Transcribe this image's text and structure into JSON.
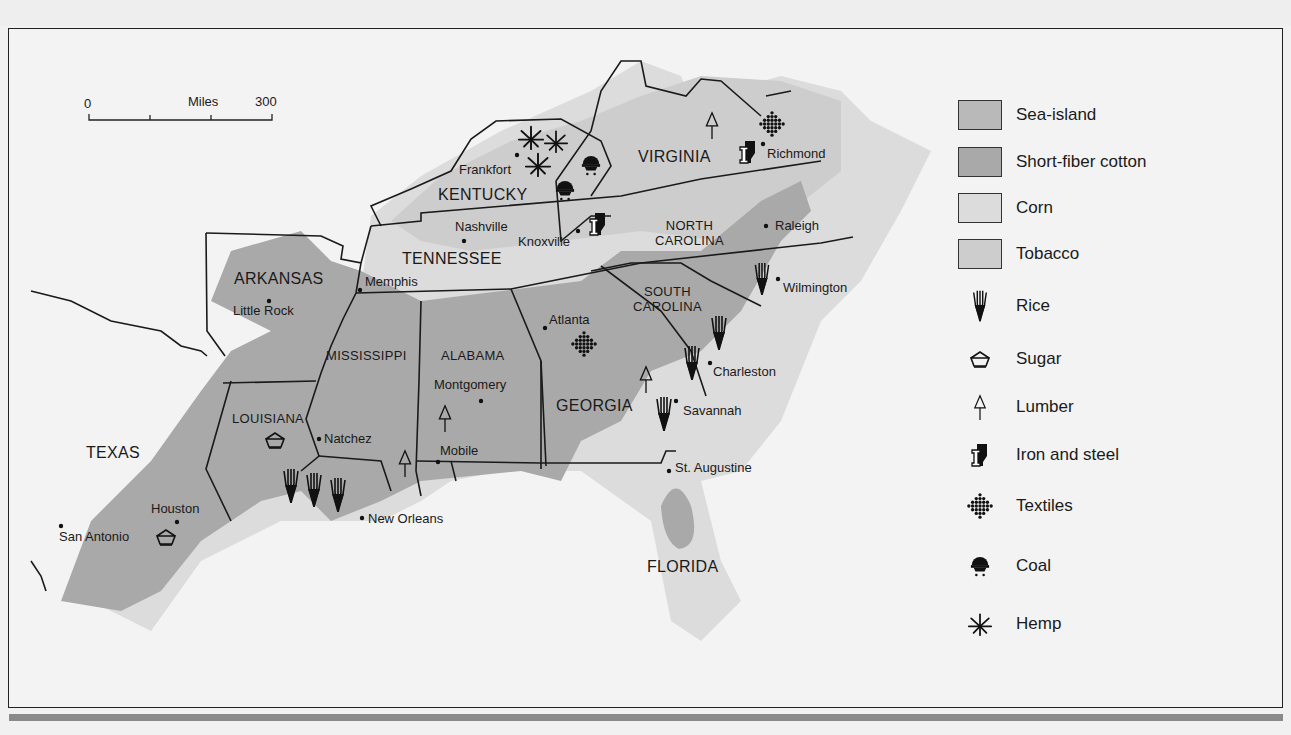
{
  "map": {
    "scale_bar": {
      "start": "0",
      "unit": "Miles",
      "end": "300"
    },
    "colors": {
      "background": "#f3f3f3",
      "sea_island": "#b9b9b9",
      "short_fiber_cotton": "#a9a9a9",
      "corn": "#dcdcdc",
      "tobacco": "#cdcdcd",
      "border": "#1a1a1a",
      "bottom_rule": "#8a8a8a"
    },
    "states": [
      {
        "name": "VIRGINIA"
      },
      {
        "name": "KENTUCKY"
      },
      {
        "name": "TENNESSEE"
      },
      {
        "name": "NORTH",
        "name2": "CAROLINA"
      },
      {
        "name": "ARKANSAS"
      },
      {
        "name": "SOUTH",
        "name2": "CAROLINA"
      },
      {
        "name": "MISSISSIPPI"
      },
      {
        "name": "ALABAMA"
      },
      {
        "name": "GEORGIA"
      },
      {
        "name": "LOUISIANA"
      },
      {
        "name": "TEXAS"
      },
      {
        "name": "FLORIDA"
      }
    ],
    "cities": [
      "Frankfort",
      "Richmond",
      "Nashville",
      "Knoxville",
      "Raleigh",
      "Memphis",
      "Little Rock",
      "Wilmington",
      "Atlanta",
      "Charleston",
      "Montgomery",
      "Savannah",
      "Natchez",
      "Mobile",
      "St. Augustine",
      "Houston",
      "New Orleans",
      "San Antonio"
    ]
  },
  "legend": {
    "areas": [
      {
        "label": "Sea-island",
        "icon": "sea-island-swatch"
      },
      {
        "label": "Short-fiber cotton",
        "icon": "short-fiber-cotton-swatch"
      },
      {
        "label": "Corn",
        "icon": "corn-swatch"
      },
      {
        "label": "Tobacco",
        "icon": "tobacco-swatch"
      }
    ],
    "symbols": [
      {
        "label": "Rice",
        "icon": "rice-icon"
      },
      {
        "label": "Sugar",
        "icon": "sugar-icon"
      },
      {
        "label": "Lumber",
        "icon": "lumber-icon"
      },
      {
        "label": "Iron and steel",
        "icon": "iron-steel-icon"
      },
      {
        "label": "Textiles",
        "icon": "textiles-icon"
      },
      {
        "label": "Coal",
        "icon": "coal-icon"
      },
      {
        "label": "Hemp",
        "icon": "hemp-icon"
      }
    ]
  }
}
